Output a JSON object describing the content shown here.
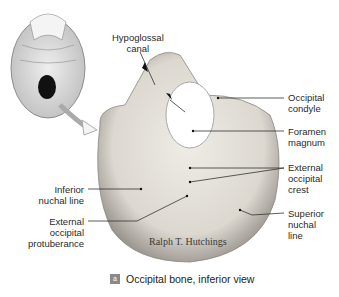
{
  "figure": {
    "caption_badge": "a",
    "caption_text": "Occipital bone, inferior view",
    "watermark": "Ralph T. Hutchings",
    "inset": "skull-inferior-view",
    "labels": {
      "hypoglossal_canal": [
        "Hypoglossal",
        "canal"
      ],
      "occipital_condyle": [
        "Occipital",
        "condyle"
      ],
      "foramen_magnum": [
        "Foramen",
        "magnum"
      ],
      "external_occipital_crest": [
        "External",
        "occipital",
        "crest"
      ],
      "superior_nuchal_line": [
        "Superior",
        "nuchal",
        "line"
      ],
      "inferior_nuchal_line": [
        "Inferior",
        "nuchal line"
      ],
      "external_occipital_protuberance": [
        "External",
        "occipital",
        "protuberance"
      ]
    },
    "colors": {
      "bone": "#e6e3dc",
      "bone_shadow": "#9a968e",
      "badge": "#8a8a8a",
      "leader_line": "#333333"
    }
  }
}
